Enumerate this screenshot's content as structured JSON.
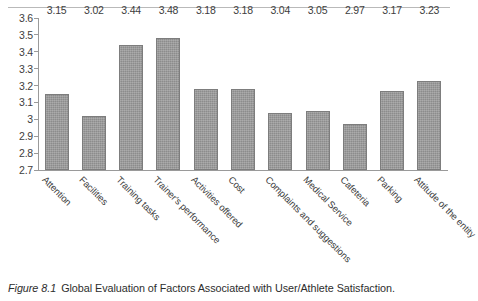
{
  "figure": {
    "caption_label": "Figure 8.1",
    "caption_text": "Global Evaluation of Factors Associated with User/Athlete Satisfaction."
  },
  "chart_data": {
    "type": "bar",
    "title": "",
    "subtitle": "",
    "xlabel": "",
    "ylabel": "",
    "ylim": [
      2.7,
      3.6
    ],
    "ytick_labels": [
      "3.6",
      "3.5",
      "3.4",
      "3.3",
      "3.2",
      "3.1",
      "3",
      "2.9",
      "2.8",
      "2.7"
    ],
    "ytick_values": [
      3.6,
      3.5,
      3.4,
      3.3,
      3.2,
      3.1,
      3.0,
      2.9,
      2.8,
      2.7
    ],
    "grid": false,
    "legend": false,
    "categories": [
      "Attention",
      "Facilities",
      "Training tasks",
      "Trainer's performance",
      "Activities offered",
      "Cost",
      "Complaints and suggestions",
      "Medical Service",
      "Cafeteria",
      "Parking",
      "Attitude of the entity"
    ],
    "values": [
      3.15,
      3.02,
      3.44,
      3.48,
      3.18,
      3.18,
      3.04,
      3.05,
      2.97,
      3.17,
      3.23
    ],
    "value_labels": [
      "3.15",
      "3.02",
      "3.44",
      "3.48",
      "3.18",
      "3.18",
      "3.04",
      "3.05",
      "2.97",
      "3.17",
      "3.23"
    ],
    "bar_color": "#8c8c8c",
    "axis_color": "#9a9a9a",
    "background_color": "#ffffff"
  }
}
